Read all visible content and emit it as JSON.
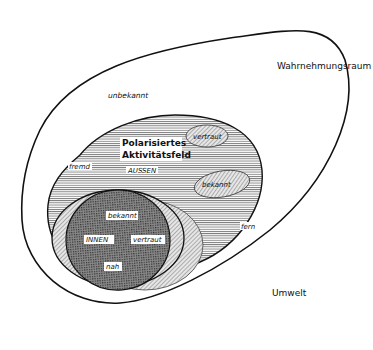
{
  "diagram": {
    "outer_region": {
      "label": "Wahrnehmungsraum",
      "sublabel": "unbekannt"
    },
    "environment_label": "Umwelt",
    "activity_field": {
      "label_line1": "Polarisiertes",
      "label_line2": "Aktivitätsfeld",
      "outer_label": "AUSSEN",
      "left_label": "fremd",
      "right_label": "fern"
    },
    "small_ellipses": [
      {
        "label": "vertraut"
      },
      {
        "label": "bekannt"
      }
    ],
    "inner_region": {
      "label": "INNEN",
      "labels": [
        "bekannt",
        "vertraut",
        "nah"
      ]
    }
  },
  "colors": {
    "stroke": "#111111",
    "background": "#ffffff"
  }
}
